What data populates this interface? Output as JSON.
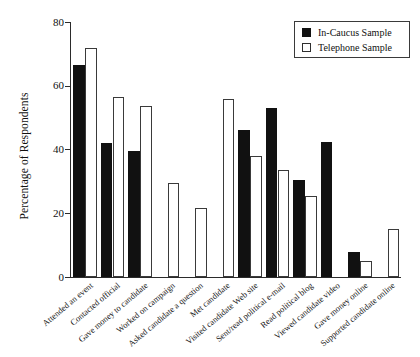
{
  "chart_data": {
    "type": "bar",
    "title": "",
    "xlabel": "",
    "ylabel": "Percentage of Respondents",
    "ylim": [
      0,
      80
    ],
    "yticks": [
      0,
      20,
      40,
      60,
      80
    ],
    "ytick_labels": [
      "0",
      "20",
      "40",
      "60",
      "80"
    ],
    "grid": false,
    "legend_position": "top-right",
    "categories": [
      "Attended an event",
      "Contacted official",
      "Gave money to candidate",
      "Worked on campaign",
      "Asked candidate a question",
      "Met candidate",
      "Visited candidate Web site",
      "Sent/read political e-mail",
      "Read political blog",
      "Viewed candidate video",
      "Gave money online",
      "Supported candidate online"
    ],
    "series": [
      {
        "name": "In-Caucus Sample",
        "style": "filled",
        "color": "#111111",
        "values": [
          66.5,
          42.0,
          39.5,
          null,
          null,
          null,
          46.0,
          53.0,
          30.5,
          42.5,
          8.0,
          null
        ]
      },
      {
        "name": "Telephone Sample",
        "style": "open",
        "color": "#ffffff",
        "values": [
          72.0,
          56.5,
          53.5,
          29.5,
          21.5,
          56.0,
          38.0,
          33.5,
          25.5,
          null,
          5.0,
          15.0
        ]
      }
    ]
  },
  "legend": {
    "entries": [
      {
        "label": "In-Caucus Sample",
        "swatch": "filled-square"
      },
      {
        "label": "Telephone Sample",
        "swatch": "open-square"
      }
    ]
  },
  "axes": {
    "y_title": "Percentage of Respondents"
  }
}
